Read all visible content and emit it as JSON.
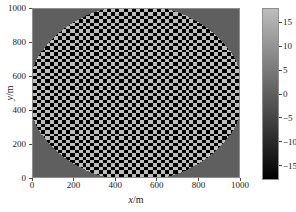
{
  "figure": {
    "background_color": "#ffffff",
    "axis_color": "#8f8f8f",
    "text_color": "#1a1a1a"
  },
  "axes": {
    "xlabel_var": "x",
    "xlabel_unit": "/m",
    "ylabel_var": "y",
    "ylabel_unit": "/m"
  },
  "colorbar": {
    "ticks": [
      {
        "label": "15",
        "value": 15
      },
      {
        "label": "10",
        "value": 10
      },
      {
        "label": "5",
        "value": 5
      },
      {
        "label": "0",
        "value": 0
      },
      {
        "label": "−5",
        "value": -5
      },
      {
        "label": "−10",
        "value": -10
      },
      {
        "label": "−15",
        "value": -15
      }
    ],
    "low_color": "#000000",
    "high_color": "#bdbdbd"
  },
  "chart_data": {
    "type": "heatmap",
    "title": "",
    "xlabel": "x/m",
    "ylabel": "y/m",
    "xlim": [
      0,
      1000
    ],
    "ylim": [
      0,
      1000
    ],
    "zlim": [
      -18,
      18
    ],
    "xticks": [
      0,
      200,
      400,
      600,
      800,
      1000
    ],
    "xticklabels": [
      "0",
      "200",
      "400",
      "600",
      "800",
      "1000"
    ],
    "yticks": [
      0,
      200,
      400,
      600,
      800,
      1000
    ],
    "yticklabels": [
      "0",
      "200",
      "400",
      "600",
      "800",
      "1000"
    ],
    "grid": false,
    "colormap": "gray",
    "cbar_ticks": [
      -15,
      -10,
      -5,
      0,
      5,
      10,
      15
    ],
    "cbar_ticklabels": [
      "−15",
      "−10",
      "−5",
      "0",
      "5",
      "10",
      "15"
    ],
    "legend": "none",
    "pattern": {
      "kind": "checkerboard",
      "cell_size_m": 20,
      "amplitude": 18,
      "background_value": 0.0,
      "mask": {
        "shape": "circle",
        "center_m": [
          500,
          500
        ],
        "radius_m": 520
      }
    }
  }
}
